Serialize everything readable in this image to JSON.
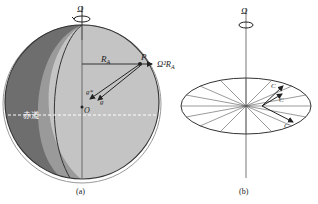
{
  "figure": {
    "panel_a": {
      "caption": "(a)",
      "omega_label": "Ω",
      "point_label": "P",
      "radius_label": "R",
      "radius_sub": "A",
      "centrifugal_label": "Ω²R",
      "centrifugal_sub": "A",
      "g_star_label": "g*",
      "g_label": "g",
      "center_label": "O",
      "equator_label": "赤道"
    },
    "panel_b": {
      "caption": "(b)",
      "omega_label": "Ω",
      "vector_labels": [
        "C",
        "C",
        "C"
      ]
    },
    "colors": {
      "dark_hemisphere": "#6e6e6e",
      "mid_band": "#9a9a9a",
      "light_hemisphere": "#c4c4c4",
      "outline": "#333333",
      "equator_dash": "#ffffff"
    }
  }
}
